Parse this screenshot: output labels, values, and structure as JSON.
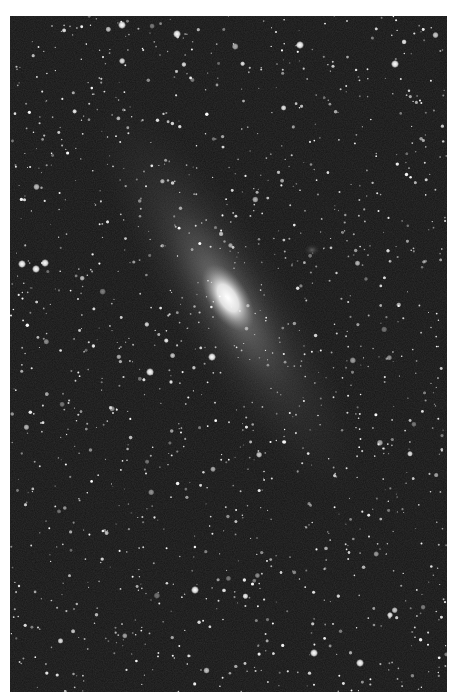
{
  "image": {
    "subject": "Andromeda Galaxy (M31) star field",
    "background_color": "#1a1a1a",
    "border_color": "#ffffff",
    "galaxy": {
      "cx": 228,
      "cy": 298,
      "angle_deg": 55,
      "core_color": "#ffffff"
    },
    "companion": {
      "cx": 312,
      "cy": 250
    },
    "bright_stars": [
      {
        "x": 22,
        "y": 264
      },
      {
        "x": 36,
        "y": 269
      },
      {
        "x": 45,
        "y": 263
      },
      {
        "x": 212,
        "y": 357
      },
      {
        "x": 195,
        "y": 590
      },
      {
        "x": 150,
        "y": 372
      },
      {
        "x": 360,
        "y": 663
      },
      {
        "x": 314,
        "y": 653
      },
      {
        "x": 300,
        "y": 45
      },
      {
        "x": 122,
        "y": 25
      },
      {
        "x": 177,
        "y": 34
      },
      {
        "x": 395,
        "y": 64
      }
    ]
  }
}
